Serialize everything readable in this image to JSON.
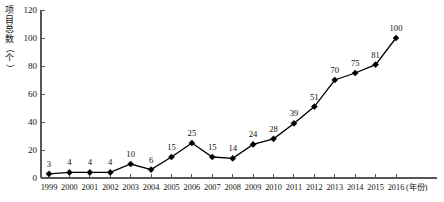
{
  "chart_data": {
    "type": "line",
    "title": "",
    "xlabel": "(年份)",
    "ylabel": "项目总数（个）",
    "ylabel_chars": [
      "项",
      "目",
      "总",
      "数",
      "（",
      "个",
      "）"
    ],
    "categories": [
      "1999",
      "2000",
      "2001",
      "2002",
      "2003",
      "2004",
      "2005",
      "2006",
      "2007",
      "2008",
      "2009",
      "2010",
      "2011",
      "2012",
      "2013",
      "2014",
      "2015",
      "2016"
    ],
    "values": [
      3,
      4,
      4,
      4,
      10,
      6,
      15,
      25,
      15,
      14,
      24,
      28,
      39,
      51,
      70,
      75,
      81,
      100
    ],
    "value_labels": [
      "3",
      "4",
      "4",
      "4",
      "10",
      "6",
      "15",
      "25",
      "15",
      "14",
      "24",
      "28",
      "39",
      "51",
      "70",
      "75",
      "81",
      "100"
    ],
    "ylim": [
      0,
      120
    ],
    "yticks": [
      0,
      20,
      40,
      60,
      80,
      100,
      120
    ],
    "ytick_labels": [
      "0",
      "20",
      "40",
      "60",
      "80",
      "100",
      "120"
    ],
    "grid": false,
    "legend": "none",
    "marker": "diamond",
    "series_color": "#000000",
    "axis_color": "#555555",
    "background": "#ffffff"
  }
}
